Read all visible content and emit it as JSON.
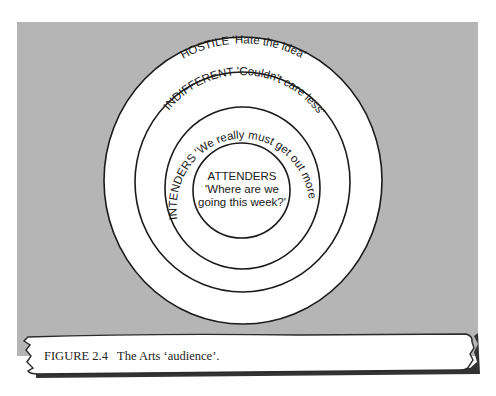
{
  "figure": {
    "caption": "FIGURE 2.4   The Arts ‘audience’.",
    "colors": {
      "background": "#ffffff",
      "panel": "#b5b5b5",
      "ring_fill": "#ffffff",
      "ring_stroke": "#1a1a1a",
      "banner_shadow": "#333333"
    }
  },
  "rings": [
    {
      "level": "outer",
      "category": "HOSTILE",
      "quote": "'Hate the idea'",
      "label": "HOSTILE 'Hate the idea'"
    },
    {
      "level": "second",
      "category": "INDIFFERENT",
      "quote": "'Couldn't care less'",
      "label": "INDIFFERENT 'Couldn't care less'"
    },
    {
      "level": "third",
      "category": "INTENDERS",
      "quote": "'We really must get out more'",
      "label": "INTENDERS 'We really must get out more'"
    },
    {
      "level": "center",
      "category": "ATTENDERS",
      "quote_line1": "'Where are we",
      "quote_line2": "going this week?'"
    }
  ]
}
